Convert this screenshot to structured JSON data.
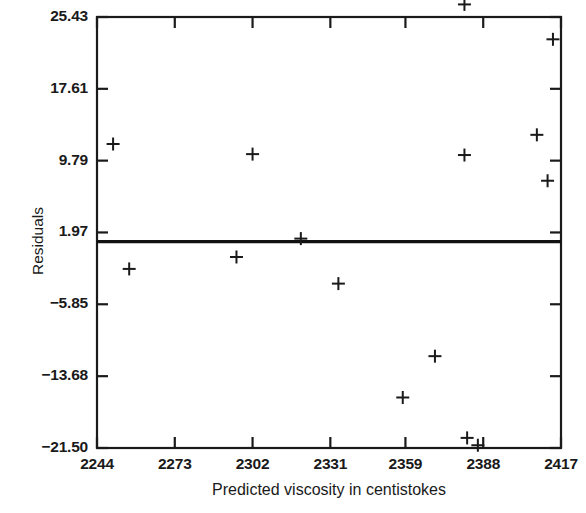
{
  "chart_data": {
    "type": "scatter",
    "title": "",
    "xlabel": "Predicted viscosity in centistokes",
    "ylabel": "Residuals",
    "xlim": [
      2244,
      2417
    ],
    "ylim": [
      -21.5,
      25.43
    ],
    "grid": false,
    "legend": null,
    "xticks": [
      2244,
      2273,
      2302,
      2331,
      2359,
      2388,
      2417
    ],
    "xtick_labels": [
      "2244",
      "2273",
      "2302",
      "2331",
      "2359",
      "2388",
      "2417"
    ],
    "yticks": [
      25.43,
      17.61,
      9.79,
      1.97,
      -5.85,
      -13.68,
      -21.5
    ],
    "ytick_labels": [
      "25.43",
      "17.61",
      "9.79",
      "1.97",
      "-5.85",
      "-13.68",
      "-21.50"
    ],
    "marker": "plus",
    "marker_color": "#1a1a1a",
    "reference_line": {
      "type": "horizontal",
      "y": 0.97,
      "color": "#111111",
      "width": 3.2
    },
    "points": [
      {
        "x": 2250,
        "y": 11.6
      },
      {
        "x": 2302,
        "y": 10.5
      },
      {
        "x": 2381,
        "y": 10.4
      },
      {
        "x": 2408,
        "y": 12.6
      },
      {
        "x": 2381,
        "y": 26.8
      },
      {
        "x": 2414,
        "y": 23.0
      },
      {
        "x": 2412,
        "y": 7.6
      },
      {
        "x": 2320,
        "y": 1.3
      },
      {
        "x": 2296,
        "y": -0.7
      },
      {
        "x": 2256,
        "y": -2.0
      },
      {
        "x": 2334,
        "y": -3.6
      },
      {
        "x": 2370,
        "y": -11.5
      },
      {
        "x": 2358,
        "y": -16.0
      },
      {
        "x": 2382,
        "y": -20.4
      },
      {
        "x": 2386,
        "y": -21.2
      }
    ]
  },
  "axis": {
    "y_title": "Residuals",
    "x_title": "Predicted viscosity in centistokes"
  }
}
